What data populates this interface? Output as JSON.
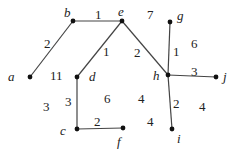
{
  "graph": {
    "vertices": [
      {
        "id": "a",
        "label": "a",
        "x": 30,
        "y": 77,
        "lx": 8,
        "ly": 70
      },
      {
        "id": "b",
        "label": "b",
        "x": 73,
        "y": 21,
        "lx": 64,
        "ly": 6
      },
      {
        "id": "e",
        "label": "e",
        "x": 122,
        "y": 21,
        "lx": 118,
        "ly": 5
      },
      {
        "id": "d",
        "label": "d",
        "x": 77,
        "y": 77,
        "lx": 89,
        "ly": 70
      },
      {
        "id": "c",
        "label": "c",
        "x": 77,
        "y": 129,
        "lx": 60,
        "ly": 124
      },
      {
        "id": "f",
        "label": "f",
        "x": 123,
        "y": 128,
        "lx": 117,
        "ly": 135
      },
      {
        "id": "g",
        "label": "g",
        "x": 170,
        "y": 22,
        "lx": 177,
        "ly": 9
      },
      {
        "id": "h",
        "label": "h",
        "x": 168,
        "y": 75,
        "lx": 153,
        "ly": 69
      },
      {
        "id": "j",
        "label": "j",
        "x": 216,
        "y": 77,
        "lx": 223,
        "ly": 70
      },
      {
        "id": "i",
        "label": "i",
        "x": 172,
        "y": 129,
        "lx": 177,
        "ly": 132
      }
    ],
    "edges": [
      {
        "from": "a",
        "to": "b",
        "weight": "2",
        "lx": 44,
        "ly": 37
      },
      {
        "from": "b",
        "to": "e",
        "weight": "1",
        "lx": 95,
        "ly": 8
      },
      {
        "from": "e",
        "to": "d",
        "weight": "1",
        "lx": 103,
        "ly": 45
      },
      {
        "from": "e",
        "to": "h",
        "weight": "2",
        "lx": 134,
        "ly": 46
      },
      {
        "from": "d",
        "to": "c",
        "weight": "3",
        "lx": 65,
        "ly": 95
      },
      {
        "from": "c",
        "to": "f",
        "weight": "2",
        "lx": 94,
        "ly": 115
      },
      {
        "from": "g",
        "to": "h",
        "weight": "1",
        "lx": 173,
        "ly": 45
      },
      {
        "from": "h",
        "to": "j",
        "weight": "3",
        "lx": 191,
        "ly": 65
      },
      {
        "from": "h",
        "to": "i",
        "weight": "2",
        "lx": 173,
        "ly": 97
      }
    ],
    "face_labels": [
      {
        "text": "11",
        "x": 50,
        "y": 69
      },
      {
        "text": "7",
        "x": 147,
        "y": 8
      },
      {
        "text": "6",
        "x": 191,
        "y": 37
      },
      {
        "text": "3",
        "x": 43,
        "y": 100
      },
      {
        "text": "6",
        "x": 104,
        "y": 92
      },
      {
        "text": "4",
        "x": 138,
        "y": 92
      },
      {
        "text": "4",
        "x": 147,
        "y": 115
      },
      {
        "text": "4",
        "x": 199,
        "y": 100
      }
    ]
  }
}
